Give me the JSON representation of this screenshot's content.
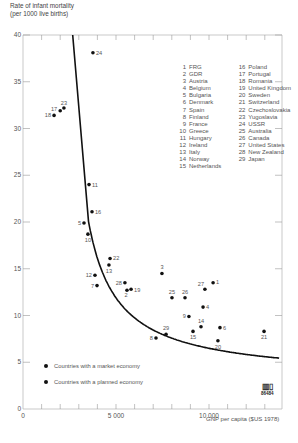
{
  "chart_data": {
    "type": "scatter",
    "title": "",
    "ylabel": "Rate of infant mortality (per 1000 live births)",
    "xlabel": "GNP per capita ($US 1978)",
    "xlim": [
      0,
      14000
    ],
    "ylim": [
      0,
      40
    ],
    "x_ticks": [
      0,
      1000,
      2000,
      3000,
      4000,
      5000,
      6000,
      7000,
      8000,
      9000,
      10000,
      11000,
      12000,
      13000
    ],
    "x_tick_labels": [
      "0",
      "5 000",
      "10 000"
    ],
    "y_tick_labels": [
      "0",
      "5",
      "10",
      "15",
      "20",
      "25",
      "30",
      "35",
      "40"
    ],
    "grid": false,
    "fit_curve": "decreasing hyperbolic trend line",
    "points": [
      {
        "id": 1,
        "country": "FRG",
        "x": 10220,
        "y": 13.5,
        "economy": "market"
      },
      {
        "id": 2,
        "country": "GDR",
        "x": 5590,
        "y": 12.7,
        "economy": "planned"
      },
      {
        "id": 3,
        "country": "Austria",
        "x": 7470,
        "y": 14.5,
        "economy": "market"
      },
      {
        "id": 4,
        "country": "Belgium",
        "x": 9680,
        "y": 10.9,
        "economy": "market"
      },
      {
        "id": 5,
        "country": "Bulgaria",
        "x": 3280,
        "y": 19.9,
        "economy": "planned"
      },
      {
        "id": 6,
        "country": "Denmark",
        "x": 10590,
        "y": 8.7,
        "economy": "market"
      },
      {
        "id": 7,
        "country": "Spain",
        "x": 3980,
        "y": 13.2,
        "economy": "market"
      },
      {
        "id": 8,
        "country": "Finland",
        "x": 7150,
        "y": 7.6,
        "economy": "market"
      },
      {
        "id": 9,
        "country": "France",
        "x": 8920,
        "y": 9.9,
        "economy": "market"
      },
      {
        "id": 10,
        "country": "Greece",
        "x": 3490,
        "y": 18.7,
        "economy": "market"
      },
      {
        "id": 11,
        "country": "Hungary",
        "x": 3550,
        "y": 24.0,
        "economy": "planned"
      },
      {
        "id": 12,
        "country": "Ireland",
        "x": 3870,
        "y": 14.3,
        "economy": "market"
      },
      {
        "id": 13,
        "country": "Italy",
        "x": 4620,
        "y": 15.4,
        "economy": "market"
      },
      {
        "id": 14,
        "country": "Norway",
        "x": 9570,
        "y": 8.8,
        "economy": "market"
      },
      {
        "id": 15,
        "country": "Netherlands",
        "x": 9140,
        "y": 8.3,
        "economy": "market"
      },
      {
        "id": 16,
        "country": "Poland",
        "x": 3710,
        "y": 21.1,
        "economy": "planned"
      },
      {
        "id": 17,
        "country": "Portugal",
        "x": 2000,
        "y": 31.9,
        "economy": "market"
      },
      {
        "id": 18,
        "country": "Romania",
        "x": 1670,
        "y": 31.4,
        "economy": "planned"
      },
      {
        "id": 19,
        "country": "United Kingdom",
        "x": 5810,
        "y": 12.8,
        "economy": "market"
      },
      {
        "id": 20,
        "country": "Sweden",
        "x": 10480,
        "y": 7.3,
        "economy": "market"
      },
      {
        "id": 21,
        "country": "Switzerland",
        "x": 12960,
        "y": 8.3,
        "economy": "market"
      },
      {
        "id": 22,
        "country": "Czechoslovakia",
        "x": 4680,
        "y": 16.1,
        "economy": "planned"
      },
      {
        "id": 23,
        "country": "Yugoslavia",
        "x": 2200,
        "y": 32.2,
        "economy": "market"
      },
      {
        "id": 24,
        "country": "USSR",
        "x": 3760,
        "y": 38.1,
        "economy": "planned"
      },
      {
        "id": 25,
        "country": "Australia",
        "x": 8010,
        "y": 11.9,
        "economy": "market"
      },
      {
        "id": 26,
        "country": "Canada",
        "x": 8710,
        "y": 11.9,
        "economy": "market"
      },
      {
        "id": 27,
        "country": "United States",
        "x": 9780,
        "y": 12.8,
        "economy": "market"
      },
      {
        "id": 28,
        "country": "New Zealand",
        "x": 5480,
        "y": 13.5,
        "economy": "market"
      },
      {
        "id": 29,
        "country": "Japan",
        "x": 7690,
        "y": 8.0,
        "economy": "market"
      }
    ],
    "legend": {
      "position": "upper-right (country key), lower-left (economy type)",
      "entries": [
        "Countries with a market economy",
        "Countries with a planned economy"
      ]
    }
  },
  "axis": {
    "ylabel_line1": "Rate of infant mortality",
    "ylabel_line2": "(per 1000 live births)",
    "xlabel": "GNP per capita ($US 1978)",
    "x_labels": {
      "zero": "0",
      "five_thousand": "5 000",
      "ten_thousand": "10 000"
    },
    "y_labels": [
      "0",
      "5",
      "10",
      "15",
      "20",
      "25",
      "30",
      "35",
      "40"
    ]
  },
  "key": {
    "col1": [
      {
        "n": "1",
        "name": "FRG"
      },
      {
        "n": "2",
        "name": "GDR"
      },
      {
        "n": "3",
        "name": "Austria"
      },
      {
        "n": "4",
        "name": "Belgium"
      },
      {
        "n": "5",
        "name": "Bulgaria"
      },
      {
        "n": "6",
        "name": "Denmark"
      },
      {
        "n": "7",
        "name": "Spain"
      },
      {
        "n": "8",
        "name": "Finland"
      },
      {
        "n": "9",
        "name": "France"
      },
      {
        "n": "10",
        "name": "Greece"
      },
      {
        "n": "11",
        "name": "Hungary"
      },
      {
        "n": "12",
        "name": "Ireland"
      },
      {
        "n": "13",
        "name": "Italy"
      },
      {
        "n": "14",
        "name": "Norway"
      },
      {
        "n": "15",
        "name": "Netherlands"
      }
    ],
    "col2": [
      {
        "n": "16",
        "name": "Poland"
      },
      {
        "n": "17",
        "name": "Portugal"
      },
      {
        "n": "18",
        "name": "Romania"
      },
      {
        "n": "19",
        "name": "United Kingdom"
      },
      {
        "n": "20",
        "name": "Sweden"
      },
      {
        "n": "21",
        "name": "Switzerland"
      },
      {
        "n": "22",
        "name": "Czechoslovakia"
      },
      {
        "n": "23",
        "name": "Yugoslavia"
      },
      {
        "n": "24",
        "name": "USSR"
      },
      {
        "n": "25",
        "name": "Australia"
      },
      {
        "n": "26",
        "name": "Canada"
      },
      {
        "n": "27",
        "name": "United States"
      },
      {
        "n": "28",
        "name": "New Zealand"
      },
      {
        "n": "29",
        "name": "Japan"
      }
    ]
  },
  "economy_legend": {
    "market": "Countries with a market economy",
    "planned": "Countries with a planned economy"
  },
  "logo": {
    "code": "86484"
  },
  "colors": {
    "axis": "#bbbbbb",
    "points": "#111111",
    "curve": "#111111",
    "text": "#555555"
  }
}
